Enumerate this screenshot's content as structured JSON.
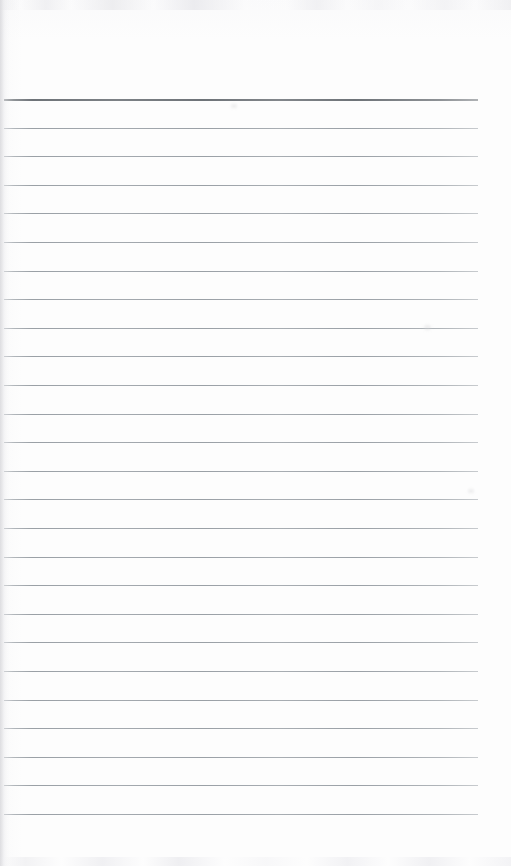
{
  "document": {
    "kind": "scanned-blank-ruled-page",
    "title": "Blank Ruled Notepad Page",
    "page_width": 511,
    "page_height": 866,
    "paper_color": "#fdfdfd",
    "has_written_content": false,
    "visible_text": ""
  },
  "rules": {
    "count": 26,
    "first_line_y": 99,
    "spacing": 28.6,
    "left_x": 4,
    "right_x": 478,
    "line_color": "#9aa0a6",
    "header_rule_color": "#6e7378",
    "header_rule_index": 0,
    "header_rule_thickness": 2,
    "body_rule_thickness": 1,
    "lines": [
      {
        "index": 0,
        "y": 99,
        "emphasis": "header"
      },
      {
        "index": 1,
        "y": 128,
        "emphasis": "body"
      },
      {
        "index": 2,
        "y": 156,
        "emphasis": "body"
      },
      {
        "index": 3,
        "y": 185,
        "emphasis": "body"
      },
      {
        "index": 4,
        "y": 213,
        "emphasis": "body"
      },
      {
        "index": 5,
        "y": 242,
        "emphasis": "body"
      },
      {
        "index": 6,
        "y": 271,
        "emphasis": "body"
      },
      {
        "index": 7,
        "y": 299,
        "emphasis": "body"
      },
      {
        "index": 8,
        "y": 328,
        "emphasis": "body"
      },
      {
        "index": 9,
        "y": 356,
        "emphasis": "body"
      },
      {
        "index": 10,
        "y": 385,
        "emphasis": "body"
      },
      {
        "index": 11,
        "y": 414,
        "emphasis": "body"
      },
      {
        "index": 12,
        "y": 442,
        "emphasis": "body"
      },
      {
        "index": 13,
        "y": 471,
        "emphasis": "body"
      },
      {
        "index": 14,
        "y": 499,
        "emphasis": "body"
      },
      {
        "index": 15,
        "y": 528,
        "emphasis": "body"
      },
      {
        "index": 16,
        "y": 557,
        "emphasis": "body"
      },
      {
        "index": 17,
        "y": 585,
        "emphasis": "body"
      },
      {
        "index": 18,
        "y": 614,
        "emphasis": "body"
      },
      {
        "index": 19,
        "y": 642,
        "emphasis": "body"
      },
      {
        "index": 20,
        "y": 671,
        "emphasis": "body"
      },
      {
        "index": 21,
        "y": 700,
        "emphasis": "body"
      },
      {
        "index": 22,
        "y": 728,
        "emphasis": "body"
      },
      {
        "index": 23,
        "y": 757,
        "emphasis": "body"
      },
      {
        "index": 24,
        "y": 785,
        "emphasis": "body"
      },
      {
        "index": 25,
        "y": 814,
        "emphasis": "body"
      }
    ]
  },
  "artifacts": {
    "top_noise_band": true,
    "bottom_noise_band": true,
    "left_binding_shadow": true,
    "smudges": [
      {
        "x": 231,
        "y": 104,
        "w": 6,
        "h": 4
      },
      {
        "x": 424,
        "y": 325,
        "w": 7,
        "h": 5
      },
      {
        "x": 468,
        "y": 489,
        "w": 6,
        "h": 4
      }
    ]
  }
}
